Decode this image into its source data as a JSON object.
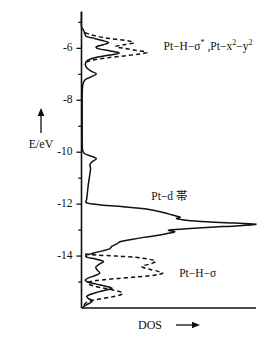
{
  "chart_data": {
    "type": "line",
    "title": "",
    "subtitle": "",
    "xlabel": "DOS",
    "ylabel": "E/eV",
    "xlabel_arrow": "→",
    "ylabel_arrow": "↑",
    "orientation": "horizontal-dos-vertical-energy",
    "grid": false,
    "legend": "none",
    "xlim": [
      0,
      1
    ],
    "ylim": [
      -16.0,
      -4.6
    ],
    "x_axis_ticks": false,
    "y_ticks": [
      -6,
      -8,
      -10,
      -12,
      -14
    ],
    "y_ticklabels": [
      "-6",
      "-8",
      "-10",
      "-12",
      "-14"
    ],
    "y_minor_ticks": [
      -5,
      -7,
      -9,
      -11,
      -13,
      -15
    ],
    "series": [
      {
        "name": "total-dos-solid",
        "style": "solid",
        "description": "Total Pt slab DOS including Pt-d band",
        "points": [
          [
            0.0,
            -4.6
          ],
          [
            0.0,
            -5.15
          ],
          [
            0.012,
            -5.3
          ],
          [
            0.02,
            -5.45
          ],
          [
            0.03,
            -5.55
          ],
          [
            0.075,
            -5.62
          ],
          [
            0.12,
            -5.7
          ],
          [
            0.155,
            -5.78
          ],
          [
            0.125,
            -5.86
          ],
          [
            0.085,
            -5.94
          ],
          [
            0.1,
            -6.02
          ],
          [
            0.165,
            -6.1
          ],
          [
            0.215,
            -6.18
          ],
          [
            0.15,
            -6.27
          ],
          [
            0.075,
            -6.36
          ],
          [
            0.035,
            -6.46
          ],
          [
            0.022,
            -6.6
          ],
          [
            0.03,
            -6.75
          ],
          [
            0.055,
            -6.88
          ],
          [
            0.085,
            -6.98
          ],
          [
            0.06,
            -7.08
          ],
          [
            0.028,
            -7.18
          ],
          [
            0.012,
            -7.3
          ],
          [
            0.006,
            -7.5
          ],
          [
            0.004,
            -7.9
          ],
          [
            0.004,
            -8.6
          ],
          [
            0.004,
            -9.4
          ],
          [
            0.006,
            -9.9
          ],
          [
            0.016,
            -10.05
          ],
          [
            0.055,
            -10.15
          ],
          [
            0.085,
            -10.25
          ],
          [
            0.062,
            -10.36
          ],
          [
            0.048,
            -10.48
          ],
          [
            0.052,
            -10.62
          ],
          [
            0.048,
            -10.85
          ],
          [
            0.04,
            -11.2
          ],
          [
            0.034,
            -11.55
          ],
          [
            0.03,
            -11.8
          ],
          [
            0.03,
            -11.95
          ],
          [
            0.1,
            -12.02
          ],
          [
            0.24,
            -12.1
          ],
          [
            0.38,
            -12.2
          ],
          [
            0.47,
            -12.32
          ],
          [
            0.52,
            -12.42
          ],
          [
            0.565,
            -12.5
          ],
          [
            0.545,
            -12.56
          ],
          [
            0.6,
            -12.62
          ],
          [
            0.72,
            -12.68
          ],
          [
            0.88,
            -12.73
          ],
          [
            1.0,
            -12.77
          ],
          [
            0.9,
            -12.83
          ],
          [
            0.74,
            -12.89
          ],
          [
            0.6,
            -12.95
          ],
          [
            0.5,
            -13.0
          ],
          [
            0.535,
            -13.06
          ],
          [
            0.5,
            -13.12
          ],
          [
            0.44,
            -13.2
          ],
          [
            0.355,
            -13.28
          ],
          [
            0.285,
            -13.36
          ],
          [
            0.225,
            -13.44
          ],
          [
            0.205,
            -13.52
          ],
          [
            0.175,
            -13.62
          ],
          [
            0.16,
            -13.72
          ],
          [
            0.12,
            -13.8
          ],
          [
            0.075,
            -13.87
          ],
          [
            0.045,
            -13.93
          ],
          [
            0.025,
            -13.98
          ],
          [
            0.035,
            -14.05
          ],
          [
            0.085,
            -14.12
          ],
          [
            0.125,
            -14.2
          ],
          [
            0.105,
            -14.3
          ],
          [
            0.082,
            -14.42
          ],
          [
            0.092,
            -14.55
          ],
          [
            0.105,
            -14.66
          ],
          [
            0.075,
            -14.76
          ],
          [
            0.04,
            -14.84
          ],
          [
            0.022,
            -14.92
          ],
          [
            0.035,
            -15.0
          ],
          [
            0.085,
            -15.08
          ],
          [
            0.14,
            -15.16
          ],
          [
            0.175,
            -15.24
          ],
          [
            0.135,
            -15.32
          ],
          [
            0.085,
            -15.4
          ],
          [
            0.048,
            -15.48
          ],
          [
            0.03,
            -15.56
          ],
          [
            0.04,
            -15.64
          ],
          [
            0.062,
            -15.72
          ],
          [
            0.05,
            -15.8
          ],
          [
            0.028,
            -15.88
          ],
          [
            0.012,
            -15.95
          ],
          [
            0.006,
            -16.0
          ]
        ]
      },
      {
        "name": "pt-h-sigma-star-dashed",
        "style": "dashed",
        "description": "Projected Pt-H-sigma* and Pt x2-y2 antibonding states",
        "points": [
          [
            0.02,
            -5.4
          ],
          [
            0.08,
            -5.52
          ],
          [
            0.16,
            -5.62
          ],
          [
            0.255,
            -5.7
          ],
          [
            0.3,
            -5.78
          ],
          [
            0.245,
            -5.86
          ],
          [
            0.195,
            -5.93
          ],
          [
            0.245,
            -6.0
          ],
          [
            0.315,
            -6.08
          ],
          [
            0.375,
            -6.15
          ],
          [
            0.33,
            -6.22
          ],
          [
            0.245,
            -6.29
          ],
          [
            0.15,
            -6.36
          ],
          [
            0.075,
            -6.44
          ],
          [
            0.03,
            -6.52
          ],
          [
            0.012,
            -6.62
          ]
        ]
      },
      {
        "name": "pt-h-sigma-dashed",
        "style": "dashed",
        "description": "Projected Pt-H-sigma bonding states",
        "points": [
          [
            0.02,
            -13.92
          ],
          [
            0.09,
            -13.96
          ],
          [
            0.2,
            -14.0
          ],
          [
            0.31,
            -14.05
          ],
          [
            0.385,
            -14.12
          ],
          [
            0.425,
            -14.2
          ],
          [
            0.395,
            -14.3
          ],
          [
            0.345,
            -14.4
          ],
          [
            0.385,
            -14.5
          ],
          [
            0.435,
            -14.58
          ],
          [
            0.465,
            -14.66
          ],
          [
            0.415,
            -14.74
          ],
          [
            0.325,
            -14.8
          ],
          [
            0.215,
            -14.86
          ],
          [
            0.115,
            -14.92
          ],
          [
            0.055,
            -14.98
          ],
          [
            0.035,
            -15.06
          ],
          [
            0.075,
            -15.16
          ],
          [
            0.145,
            -15.26
          ],
          [
            0.215,
            -15.36
          ],
          [
            0.235,
            -15.46
          ],
          [
            0.185,
            -15.56
          ],
          [
            0.115,
            -15.64
          ],
          [
            0.055,
            -15.72
          ],
          [
            0.025,
            -15.8
          ],
          [
            0.012,
            -15.9
          ]
        ]
      }
    ],
    "annotations": [
      {
        "name": "pt-h-sigma-star-label",
        "text": "Pt−H−σ* , Pt−x²−y²",
        "energy": -5.95,
        "dos": 0.47,
        "parts": [
          {
            "t": "Pt−H−σ",
            "sup": false
          },
          {
            "t": "*",
            "sup": true
          },
          {
            "t": " ,Pt−x",
            "sup": false
          },
          {
            "t": "2",
            "sup": true
          },
          {
            "t": "−y",
            "sup": false
          },
          {
            "t": "2",
            "sup": true
          }
        ]
      },
      {
        "name": "pt-d-band-label",
        "text": "Pt−d 帯",
        "energy": -11.72,
        "dos": 0.4,
        "parts": [
          {
            "t": "Pt−d 帯",
            "sup": false
          }
        ]
      },
      {
        "name": "pt-h-sigma-label",
        "text": "Pt−H−σ",
        "energy": -14.7,
        "dos": 0.56,
        "parts": [
          {
            "t": "Pt−H−σ",
            "sup": false
          }
        ]
      }
    ]
  },
  "figure": {
    "xaxis_caption": "DOS",
    "yaxis_caption": "E/eV"
  }
}
